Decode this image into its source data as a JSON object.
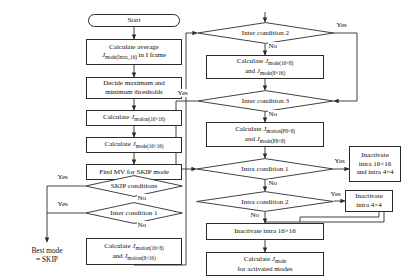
{
  "diagram": {
    "type": "flowchart",
    "colors": {
      "stroke": "#2b2b2b",
      "background": "#ffffff",
      "text": "#111111"
    },
    "nodes": {
      "start": {
        "label": "Start",
        "shape": "terminator"
      },
      "calc_avg": {
        "line1": "Calculate average",
        "line2_pre": "",
        "jsym": "J",
        "jsub": "mode(Intra_16)",
        "line2_post": " in I frame"
      },
      "thresholds": {
        "line1": "Decide maximum and",
        "line2": "minimum thresholds"
      },
      "calc_motion16": {
        "pre": "Calculate ",
        "jsym": "J",
        "jsub": "motion(16×16)"
      },
      "calc_mode16": {
        "pre": "Calculate ",
        "jsym": "J",
        "jsub": "mode(16×16)"
      },
      "find_mv_skip": {
        "label": "Find MV for SKIP mode"
      },
      "skip_conditions": {
        "label": "SKIP conditions",
        "shape": "decision"
      },
      "inter_condition_1": {
        "label": "Inter condition 1",
        "shape": "decision"
      },
      "calc_motion_16x8": {
        "pre": "Calculate ",
        "jsym": "J",
        "jsub": "motion(16×8)",
        "line2_pre": "and ",
        "jsym2": "J",
        "jsub2": "motion(8×16)"
      },
      "best_mode_skip": {
        "line1": "Best mode",
        "line2": "= SKIP"
      },
      "inter_condition_2": {
        "label": "Inter condition 2",
        "shape": "decision"
      },
      "calc_mode_16x8": {
        "pre": "Calculate ",
        "jsym": "J",
        "jsub": "mode(16×8)",
        "line2_pre": "and ",
        "jsym2": "J",
        "jsub2": "mode(8×16)"
      },
      "inter_condition_3": {
        "label": "Inter condition 3",
        "shape": "decision"
      },
      "calc_p8x8": {
        "pre": "Calculate ",
        "jsym": "J",
        "jsub": "motion(P8×8)",
        "line2_pre": "and ",
        "jsym2": "J",
        "jsub2": "mode(P8×8)"
      },
      "intra_condition_1": {
        "label": "Intra condition 1",
        "shape": "decision"
      },
      "intra_condition_2": {
        "label": "Intra condition 2",
        "shape": "decision"
      },
      "inactivate_both": {
        "line1": "Inactivate",
        "line2": "intra 16×16",
        "line3": "and intra 4×4"
      },
      "inactivate_4x4": {
        "line1": "Inactivate",
        "line2": "intra 4×4"
      },
      "inactivate_16x16": {
        "label": "Inactivate intra 16×16"
      },
      "calc_jmode_activated": {
        "pre": "Calculate ",
        "jsym": "J",
        "jsub": "mode",
        "line2": "for activated modes"
      },
      "decide_best": {
        "label": "Decide the best mode",
        "shape": "terminator"
      }
    },
    "edge_labels": {
      "skip_yes": "Yes",
      "skip_no": "No",
      "inter1_yes": "Yes",
      "inter1_no": "No",
      "inter2_yes": "Yes",
      "inter2_no": "No",
      "inter3_yes": "Yes",
      "inter3_no": "No",
      "intra1_yes": "Yes",
      "intra1_no": "No",
      "intra2_yes": "Yes",
      "intra2_no": "No"
    }
  }
}
